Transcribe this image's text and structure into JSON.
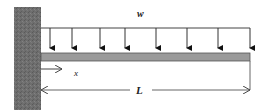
{
  "diagram": {
    "labels": {
      "load": "w",
      "position": "x",
      "length": "L"
    },
    "colors": {
      "wall": "#6e6e6e",
      "beam": "#9a9a9a",
      "line": "#444444",
      "background": "#ffffff"
    },
    "load_arrow_count": 8
  }
}
